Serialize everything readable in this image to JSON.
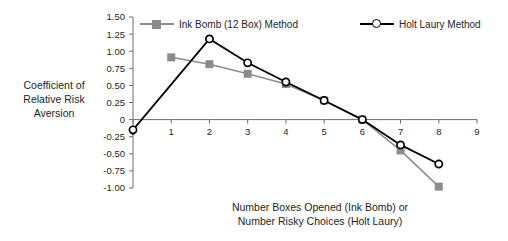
{
  "chart_data": {
    "type": "line",
    "title": "",
    "xlabel": "Number Boxes Opened (Ink Bomb) or Number Risky Choices (Holt Laury)",
    "xlabel_line1": "Number Boxes Opened (Ink Bomb) or",
    "xlabel_line2": "Number Risky Choices (Holt Laury)",
    "ylabel": "Coefficient of Relative Risk Aversion",
    "ylabel_line1": "Coefficient of",
    "ylabel_line2": "Relative Risk",
    "ylabel_line3": "Aversion",
    "xlim": [
      0,
      9
    ],
    "ylim": [
      -1.0,
      1.5
    ],
    "xticks": [
      "0",
      "1",
      "2",
      "3",
      "4",
      "5",
      "6",
      "7",
      "8",
      "9"
    ],
    "yticks": [
      "1.50",
      "1.25",
      "1.00",
      "0.75",
      "0.50",
      "0.25",
      "0",
      "-0.25",
      "-0.50",
      "-0.75",
      "-1.00"
    ],
    "ytick_values": [
      1.5,
      1.25,
      1.0,
      0.75,
      0.5,
      0.25,
      0,
      -0.25,
      -0.5,
      -0.75,
      -1.0
    ],
    "grid": false,
    "legend_position": "top",
    "series": [
      {
        "name": "Ink Bomb (12 Box) Method",
        "color": "#8c8c8c",
        "marker": "square",
        "x": [
          1,
          2,
          3,
          4,
          5,
          6,
          7,
          8
        ],
        "values": [
          0.91,
          0.81,
          0.67,
          0.52,
          0.28,
          0.0,
          -0.45,
          -0.98
        ]
      },
      {
        "name": "Holt Laury Method",
        "color": "#000000",
        "marker": "circle",
        "x": [
          0,
          2,
          3,
          4,
          5,
          6,
          7,
          8
        ],
        "values": [
          -0.15,
          1.18,
          0.83,
          0.55,
          0.28,
          0.0,
          -0.37,
          -0.65
        ]
      }
    ]
  },
  "legend": {
    "items": [
      {
        "label": "Ink Bomb (12 Box) Method",
        "color": "#8c8c8c",
        "marker": "square"
      },
      {
        "label": "Holt Laury Method",
        "color": "#000000",
        "marker": "circle"
      }
    ]
  }
}
